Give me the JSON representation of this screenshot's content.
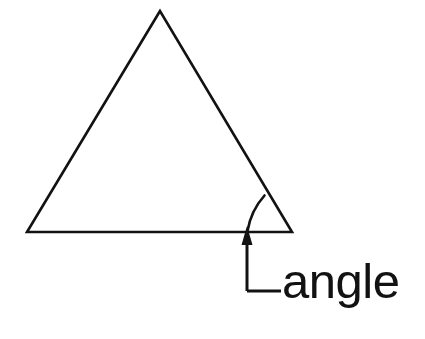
{
  "figure": {
    "title": "angle",
    "background_color": "#ffffff",
    "stroke_color": "#121212",
    "text_color": "#121212",
    "stroke_width": 2.6
  },
  "shape": {
    "name": "triangle",
    "vertices": {
      "apex": {
        "x": 160,
        "y": 11
      },
      "bottom_left": {
        "x": 27,
        "y": 232
      },
      "bottom_right": {
        "x": 292,
        "y": 232
      }
    },
    "path": "M 160 11 L 27 232 L 292 232 Z"
  },
  "angle_marker": {
    "name": "angle-arc",
    "at_vertex": "bottom_right",
    "path": "M 247.5 231 C 250 216 256 205 264.5 195.5"
  },
  "annotation": {
    "label": "angle",
    "arrow": {
      "tip": {
        "x": 247,
        "y": 226
      },
      "shaft_top": {
        "x": 247,
        "y": 244
      },
      "shaft_bottom": {
        "x": 247,
        "y": 291
      },
      "head_half_width": 5.5,
      "head_length": 19
    },
    "leader": {
      "from": {
        "x": 247,
        "y": 291
      },
      "to": {
        "x": 281,
        "y": 291
      }
    },
    "text_position": {
      "x": 282,
      "y": 298
    },
    "font_size": 49
  }
}
